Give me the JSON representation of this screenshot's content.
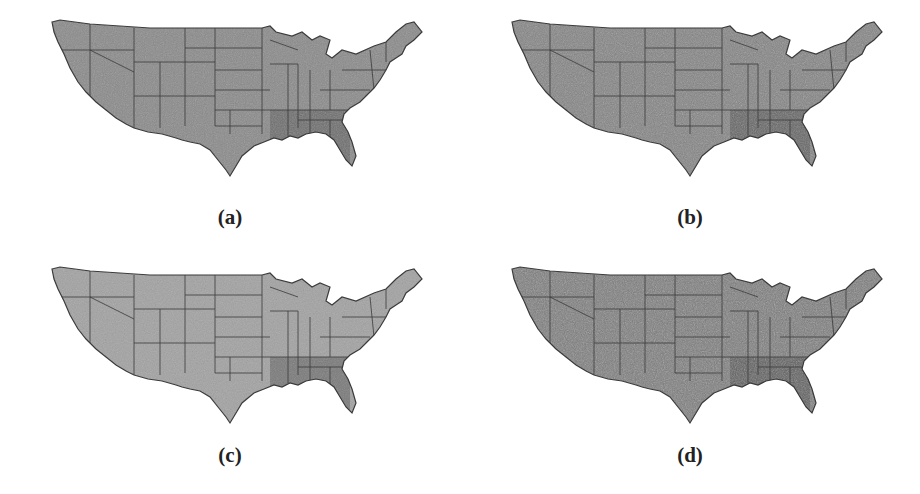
{
  "figure": {
    "panels": [
      {
        "id": "a",
        "caption": "(a)",
        "fill": "#8a8a8a",
        "southeast_fill": "#6f6f6f",
        "texture_opacity": 0.35
      },
      {
        "id": "b",
        "caption": "(b)",
        "fill": "#848484",
        "southeast_fill": "#666666",
        "texture_opacity": 0.45
      },
      {
        "id": "c",
        "caption": "(c)",
        "fill": "#a2a2a2",
        "southeast_fill": "#7a7a7a",
        "texture_opacity": 0.3
      },
      {
        "id": "d",
        "caption": "(d)",
        "fill": "#7c7c7c",
        "southeast_fill": "#5e5e5e",
        "texture_opacity": 0.55
      }
    ],
    "map_subject": "Contiguous United States with state boundaries",
    "border_color": "#3a3a3a",
    "background": "#ffffff"
  }
}
